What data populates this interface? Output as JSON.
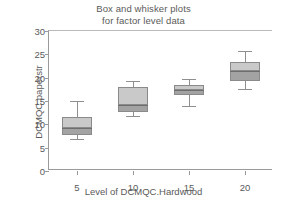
{
  "chart_data": {
    "type": "box",
    "title": "Box and whisker plots for factor level data",
    "title_lines": [
      "Box and whisker plots",
      "for factor level data"
    ],
    "xlabel": "Level of DCMQC.Hardwood",
    "ylabel": "DCMQC.paperstr",
    "xlim": [
      2.5,
      22.5
    ],
    "ylim": [
      0,
      30
    ],
    "yticks": [
      0,
      5,
      10,
      15,
      20,
      25,
      30
    ],
    "ytick_labels": [
      "0",
      "5",
      "10",
      "15",
      "20",
      "25",
      "30"
    ],
    "xticks": [
      5,
      10,
      15,
      20
    ],
    "xtick_labels": [
      "5",
      "10",
      "15",
      "20"
    ],
    "grid": false,
    "legend": "none",
    "categories": [
      "5",
      "10",
      "15",
      "20"
    ],
    "boxes": [
      {
        "category": "5",
        "x": 5,
        "whisker_low": 6.8,
        "q1": 7.7,
        "median": 9.2,
        "q3": 11.5,
        "whisker_high": 15.0
      },
      {
        "category": "10",
        "x": 10,
        "whisker_low": 11.8,
        "q1": 12.6,
        "median": 14.2,
        "q3": 18.0,
        "whisker_high": 19.3
      },
      {
        "category": "15",
        "x": 15,
        "whisker_low": 13.9,
        "q1": 16.3,
        "median": 17.4,
        "q3": 18.4,
        "whisker_high": 19.7
      },
      {
        "category": "20",
        "x": 20,
        "whisker_low": 17.6,
        "q1": 19.3,
        "median": 21.4,
        "q3": 23.4,
        "whisker_high": 25.7
      }
    ],
    "colors": {
      "box_upper_fill": "#c9c9c9",
      "box_lower_fill": "#a3a3a3",
      "box_stroke": "#8a8a8a",
      "median": "#6e6e6e",
      "whisker": "#8f8f8f",
      "axis": "#9a9a9a",
      "text": "#5a5a5a",
      "background": "#ffffff"
    }
  }
}
